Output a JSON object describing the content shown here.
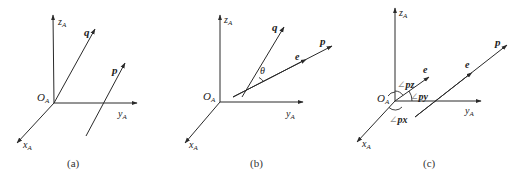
{
  "figure": {
    "panels": [
      {
        "id": "a",
        "caption": "(a)",
        "origin_label": "O",
        "origin_sub": "A",
        "axes": {
          "z": "z",
          "y": "y",
          "x": "x",
          "sub": "A"
        },
        "vectors": {
          "q": "q",
          "p": "p"
        }
      },
      {
        "id": "b",
        "caption": "(b)",
        "origin_label": "O",
        "origin_sub": "A",
        "axes": {
          "z": "z",
          "y": "y",
          "x": "x",
          "sub": "A"
        },
        "vectors": {
          "q": "q",
          "p": "p",
          "e": "e"
        },
        "angle": "θ"
      },
      {
        "id": "c",
        "caption": "(c)",
        "origin_label": "O",
        "origin_sub": "A",
        "axes": {
          "z": "z",
          "y": "y",
          "x": "x",
          "sub": "A"
        },
        "vectors": {
          "p": "p",
          "e1": "e",
          "e2": "e"
        },
        "angles": {
          "pz_sym": "∠",
          "pz": "pz",
          "py_sym": "∠",
          "py": "py",
          "px_sym": "∠",
          "px": "px"
        }
      }
    ]
  }
}
